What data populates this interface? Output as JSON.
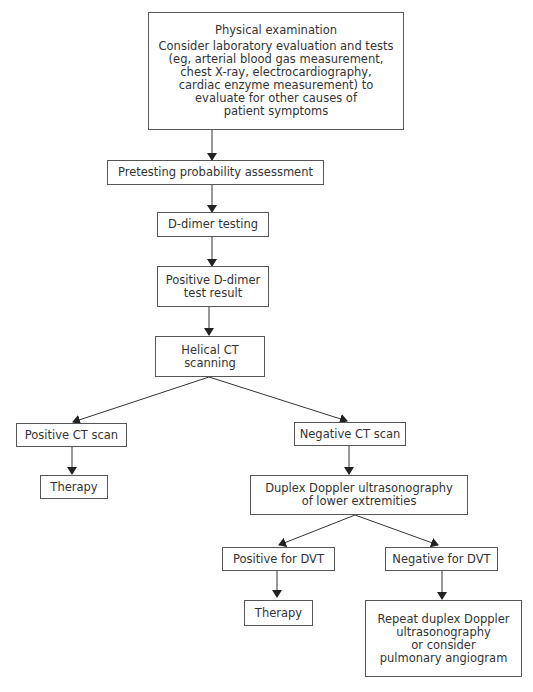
{
  "diagram": {
    "type": "flowchart",
    "nodes": {
      "physical_exam": {
        "title": "Physical examination",
        "lines": [
          "Consider laboratory evaluation and tests",
          "(eg, arterial blood gas measurement,",
          "chest X-ray, electrocardiography,",
          "cardiac enzyme measurement) to",
          "evaluate for other causes of",
          "patient symptoms"
        ]
      },
      "pretest": {
        "lines": [
          "Pretesting probability assessment"
        ]
      },
      "ddimer": {
        "lines": [
          "D-dimer testing"
        ]
      },
      "pos_ddimer": {
        "lines": [
          "Positive D-dimer",
          "test result"
        ]
      },
      "helical_ct": {
        "lines": [
          "Helical CT",
          "scanning"
        ]
      },
      "pos_ct": {
        "lines": [
          "Positive CT scan"
        ]
      },
      "neg_ct": {
        "lines": [
          "Negative CT scan"
        ]
      },
      "therapy_1": {
        "lines": [
          "Therapy"
        ]
      },
      "duplex": {
        "lines": [
          "Duplex Doppler ultrasonography",
          "of lower extremities"
        ]
      },
      "pos_dvt": {
        "lines": [
          "Positive for DVT"
        ]
      },
      "neg_dvt": {
        "lines": [
          "Negative for DVT"
        ]
      },
      "therapy_2": {
        "lines": [
          "Therapy"
        ]
      },
      "repeat": {
        "lines": [
          "Repeat duplex Doppler",
          "ultrasonography",
          "or consider",
          "pulmonary angiogram"
        ]
      }
    },
    "edges": [
      [
        "physical_exam",
        "pretest"
      ],
      [
        "pretest",
        "ddimer"
      ],
      [
        "ddimer",
        "pos_ddimer"
      ],
      [
        "pos_ddimer",
        "helical_ct"
      ],
      [
        "helical_ct",
        "pos_ct"
      ],
      [
        "helical_ct",
        "neg_ct"
      ],
      [
        "pos_ct",
        "therapy_1"
      ],
      [
        "neg_ct",
        "duplex"
      ],
      [
        "duplex",
        "pos_dvt"
      ],
      [
        "duplex",
        "neg_dvt"
      ],
      [
        "pos_dvt",
        "therapy_2"
      ],
      [
        "neg_dvt",
        "repeat"
      ]
    ],
    "colors": {
      "line": "#333333",
      "border": "#555555",
      "text": "#333333"
    }
  }
}
